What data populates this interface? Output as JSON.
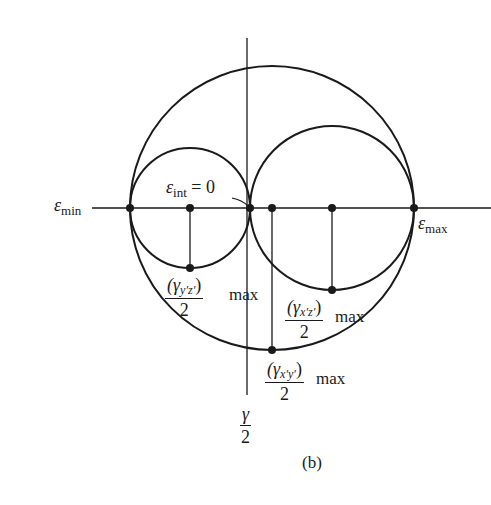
{
  "figure": {
    "caption": "(b)",
    "type": "Mohr's circles for 3D strain"
  },
  "labels": {
    "eps_min": {
      "symbol": "ε",
      "sub": "min"
    },
    "eps_max": {
      "symbol": "ε",
      "sub": "max"
    },
    "eps_int": {
      "symbol": "ε",
      "sub": "int",
      "eq": " = 0"
    },
    "gamma_yz": {
      "num_open": "(γ",
      "num_sub": "y′z′",
      "num_close": ")",
      "max": "max",
      "den": "2"
    },
    "gamma_xz": {
      "num_open": "(γ",
      "num_sub": "x′z′",
      "num_close": ")",
      "max": "max",
      "den": "2"
    },
    "gamma_xy": {
      "num_open": "(γ",
      "num_sub": "x′y′",
      "num_close": ")",
      "max": "max",
      "den": "2"
    },
    "axis_gamma": {
      "num": "γ",
      "den": "2"
    }
  },
  "colors": {
    "stroke": "#1a1a1a",
    "background": "#ffffff"
  }
}
